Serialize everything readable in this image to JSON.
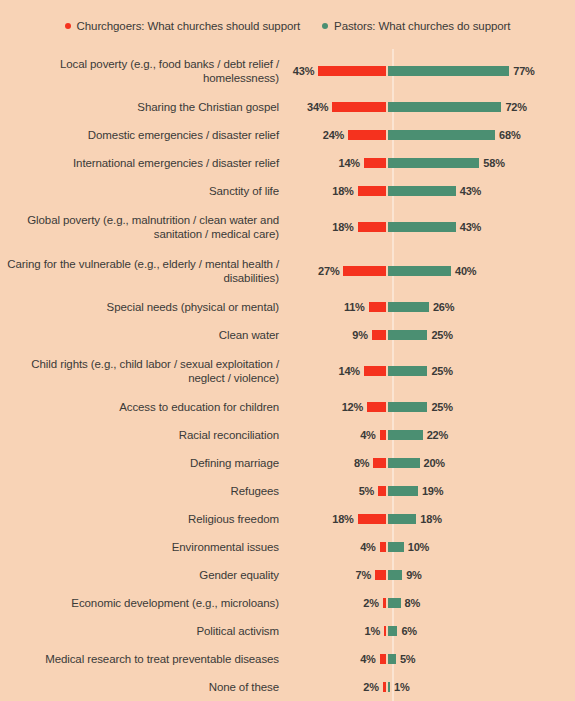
{
  "legend": {
    "entries": [
      {
        "label": "Churchgoers: What churches should support",
        "color": "#f5321e",
        "icon": "legend-dot-red"
      },
      {
        "label": "Pastors: What churches do support",
        "color": "#4b8f72",
        "icon": "legend-dot-green"
      }
    ]
  },
  "colors": {
    "background": "#f8d3b6",
    "churchgoers": "#f5321e",
    "pastors": "#4b8f72",
    "center_line": "#fbe4d2",
    "text": "#3a3a38"
  },
  "chart_data": {
    "type": "bar",
    "title": "",
    "subtype": "diverging-paired-bar",
    "xlabel": "",
    "ylabel": "",
    "grid": false,
    "legend_position": "top-center",
    "value_suffix": "%",
    "axis_max": 80,
    "series": [
      {
        "name": "Churchgoers: What churches should support",
        "color": "#f5321e",
        "side": "left",
        "values": [
          43,
          34,
          24,
          14,
          18,
          18,
          27,
          11,
          9,
          14,
          12,
          4,
          8,
          5,
          18,
          4,
          7,
          2,
          1,
          4,
          2
        ]
      },
      {
        "name": "Pastors: What churches do support",
        "color": "#4b8f72",
        "side": "right",
        "values": [
          77,
          72,
          68,
          58,
          43,
          43,
          40,
          26,
          25,
          25,
          25,
          22,
          20,
          19,
          18,
          10,
          9,
          8,
          6,
          5,
          1
        ]
      }
    ],
    "categories": [
      "Local poverty (e.g., food banks / debt relief / homelessness)",
      "Sharing the Christian gospel",
      "Domestic emergencies / disaster relief",
      "International emergencies / disaster relief",
      "Sanctity of life",
      "Global poverty (e.g., malnutrition / clean water and sanitation / medical care)",
      "Caring for the vulnerable (e.g., elderly / mental health / disabilities)",
      "Special needs (physical or mental)",
      "Clean water",
      "Child rights (e.g., child labor / sexual exploitation / neglect / violence)",
      "Access to education for children",
      "Racial reconciliation",
      "Defining marriage",
      "Refugees",
      "Religious freedom",
      "Environmental issues",
      "Gender equality",
      "Economic development (e.g., microloans)",
      "Political activism",
      "Medical research to treat preventable diseases",
      "None of these"
    ],
    "rows": [
      {
        "category": "Local poverty (e.g., food banks / debt relief / homelessness)",
        "churchgoers": 43,
        "pastors": 77,
        "churchgoers_label": "43%",
        "pastors_label": "77%",
        "lines": 2
      },
      {
        "category": "Sharing the Christian gospel",
        "churchgoers": 34,
        "pastors": 72,
        "churchgoers_label": "34%",
        "pastors_label": "72%",
        "lines": 1
      },
      {
        "category": "Domestic emergencies / disaster relief",
        "churchgoers": 24,
        "pastors": 68,
        "churchgoers_label": "24%",
        "pastors_label": "68%",
        "lines": 1
      },
      {
        "category": "International emergencies / disaster relief",
        "churchgoers": 14,
        "pastors": 58,
        "churchgoers_label": "14%",
        "pastors_label": "58%",
        "lines": 1
      },
      {
        "category": "Sanctity of life",
        "churchgoers": 18,
        "pastors": 43,
        "churchgoers_label": "18%",
        "pastors_label": "43%",
        "lines": 1
      },
      {
        "category": "Global poverty (e.g., malnutrition / clean water and sanitation / medical care)",
        "churchgoers": 18,
        "pastors": 43,
        "churchgoers_label": "18%",
        "pastors_label": "43%",
        "lines": 2
      },
      {
        "category": "Caring for the vulnerable (e.g., elderly / mental health / disabilities)",
        "churchgoers": 27,
        "pastors": 40,
        "churchgoers_label": "27%",
        "pastors_label": "40%",
        "lines": 2
      },
      {
        "category": "Special needs (physical or mental)",
        "churchgoers": 11,
        "pastors": 26,
        "churchgoers_label": "11%",
        "pastors_label": "26%",
        "lines": 1
      },
      {
        "category": "Clean water",
        "churchgoers": 9,
        "pastors": 25,
        "churchgoers_label": "9%",
        "pastors_label": "25%",
        "lines": 1
      },
      {
        "category": "Child rights (e.g., child labor / sexual exploitation / neglect / violence)",
        "churchgoers": 14,
        "pastors": 25,
        "churchgoers_label": "14%",
        "pastors_label": "25%",
        "lines": 2
      },
      {
        "category": "Access to education for children",
        "churchgoers": 12,
        "pastors": 25,
        "churchgoers_label": "12%",
        "pastors_label": "25%",
        "lines": 1
      },
      {
        "category": "Racial reconciliation",
        "churchgoers": 4,
        "pastors": 22,
        "churchgoers_label": "4%",
        "pastors_label": "22%",
        "lines": 1
      },
      {
        "category": "Defining marriage",
        "churchgoers": 8,
        "pastors": 20,
        "churchgoers_label": "8%",
        "pastors_label": "20%",
        "lines": 1
      },
      {
        "category": "Refugees",
        "churchgoers": 5,
        "pastors": 19,
        "churchgoers_label": "5%",
        "pastors_label": "19%",
        "lines": 1
      },
      {
        "category": "Religious freedom",
        "churchgoers": 18,
        "pastors": 18,
        "churchgoers_label": "18%",
        "pastors_label": "18%",
        "lines": 1
      },
      {
        "category": "Environmental issues",
        "churchgoers": 4,
        "pastors": 10,
        "churchgoers_label": "4%",
        "pastors_label": "10%",
        "lines": 1
      },
      {
        "category": "Gender equality",
        "churchgoers": 7,
        "pastors": 9,
        "churchgoers_label": "7%",
        "pastors_label": "9%",
        "lines": 1
      },
      {
        "category": "Economic development (e.g., microloans)",
        "churchgoers": 2,
        "pastors": 8,
        "churchgoers_label": "2%",
        "pastors_label": "8%",
        "lines": 1
      },
      {
        "category": "Political activism",
        "churchgoers": 1,
        "pastors": 6,
        "churchgoers_label": "1%",
        "pastors_label": "6%",
        "lines": 1
      },
      {
        "category": "Medical research to treat preventable diseases",
        "churchgoers": 4,
        "pastors": 5,
        "churchgoers_label": "4%",
        "pastors_label": "5%",
        "lines": 1
      },
      {
        "category": "None of these",
        "churchgoers": 2,
        "pastors": 1,
        "churchgoers_label": "2%",
        "pastors_label": "1%",
        "lines": 1
      }
    ]
  }
}
